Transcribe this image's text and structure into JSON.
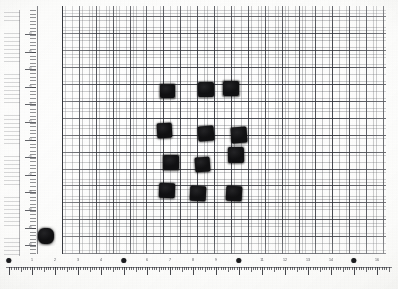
{
  "image": {
    "kind": "scanned-photograph",
    "subject": "black square specimens arranged on graph paper",
    "background_color": "#fdfdfc",
    "specimen_color": "#121214",
    "grid_minor_color": "#46484e",
    "grid_major_color": "#2d2f36",
    "ruler_text_color": "#53555b"
  },
  "grid": {
    "label": "graph-paper",
    "minor_cell_px": 3.38,
    "major_cell_px": 16.9,
    "minor_per_major": 5,
    "left_px": 62,
    "top_px": 6,
    "width_px": 324,
    "height_px": 248
  },
  "specimens": {
    "count": 13,
    "note": "12 squares in a clustered array plus 1 isolated square at lower left",
    "items": [
      {
        "id": "s1",
        "x": 160,
        "y": 84,
        "w": 15,
        "h": 14,
        "shape": "square",
        "group": "array"
      },
      {
        "id": "s2",
        "x": 198,
        "y": 82,
        "w": 16,
        "h": 15,
        "shape": "square",
        "group": "array"
      },
      {
        "id": "s3",
        "x": 223,
        "y": 81,
        "w": 16,
        "h": 15,
        "shape": "square",
        "group": "array"
      },
      {
        "id": "s4",
        "x": 157,
        "y": 123,
        "w": 15,
        "h": 15,
        "shape": "square",
        "group": "array"
      },
      {
        "id": "s5",
        "x": 198,
        "y": 126,
        "w": 16,
        "h": 15,
        "shape": "square",
        "group": "array"
      },
      {
        "id": "s6",
        "x": 231,
        "y": 127,
        "w": 16,
        "h": 16,
        "shape": "square",
        "group": "array"
      },
      {
        "id": "s7",
        "x": 163,
        "y": 155,
        "w": 16,
        "h": 15,
        "shape": "square",
        "group": "array"
      },
      {
        "id": "s8",
        "x": 195,
        "y": 157,
        "w": 15,
        "h": 15,
        "shape": "square",
        "group": "array"
      },
      {
        "id": "s9",
        "x": 228,
        "y": 147,
        "w": 16,
        "h": 16,
        "shape": "square",
        "group": "array"
      },
      {
        "id": "s10",
        "x": 159,
        "y": 183,
        "w": 16,
        "h": 15,
        "shape": "square",
        "group": "array"
      },
      {
        "id": "s11",
        "x": 190,
        "y": 186,
        "w": 16,
        "h": 15,
        "shape": "square",
        "group": "array"
      },
      {
        "id": "s12",
        "x": 226,
        "y": 186,
        "w": 16,
        "h": 15,
        "shape": "square",
        "group": "array"
      },
      {
        "id": "s13",
        "x": 38,
        "y": 228,
        "w": 16,
        "h": 16,
        "shape": "blob",
        "group": "isolated"
      }
    ]
  },
  "vertical_ruler": {
    "name": "left-scale",
    "orientation": "vertical",
    "labels": [
      {
        "y": 30,
        "text": "40"
      },
      {
        "y": 48,
        "text": "35"
      },
      {
        "y": 65,
        "text": "30"
      },
      {
        "y": 83,
        "text": "25"
      },
      {
        "y": 100,
        "text": "20"
      },
      {
        "y": 118,
        "text": "15"
      },
      {
        "y": 136,
        "text": "10"
      },
      {
        "y": 153,
        "text": "05"
      },
      {
        "y": 171,
        "text": "00"
      },
      {
        "y": 188,
        "text": "95"
      },
      {
        "y": 206,
        "text": "90"
      },
      {
        "y": 224,
        "text": "85"
      },
      {
        "y": 241,
        "text": "80"
      }
    ]
  },
  "horizontal_ruler": {
    "name": "bottom-scale-bar",
    "orientation": "horizontal",
    "labels": [
      {
        "x": 9,
        "text": "0",
        "marker": "dot"
      },
      {
        "x": 32,
        "text": "1"
      },
      {
        "x": 55,
        "text": "2"
      },
      {
        "x": 78,
        "text": "3"
      },
      {
        "x": 101,
        "text": "4"
      },
      {
        "x": 124,
        "text": "5",
        "marker": "dot"
      },
      {
        "x": 147,
        "text": "6"
      },
      {
        "x": 170,
        "text": "7"
      },
      {
        "x": 193,
        "text": "8"
      },
      {
        "x": 216,
        "text": "9"
      },
      {
        "x": 239,
        "text": "10",
        "marker": "dot"
      },
      {
        "x": 262,
        "text": "11"
      },
      {
        "x": 285,
        "text": "12"
      },
      {
        "x": 308,
        "text": "13"
      },
      {
        "x": 331,
        "text": "14"
      },
      {
        "x": 354,
        "text": "15",
        "marker": "dot"
      },
      {
        "x": 377,
        "text": "16"
      }
    ],
    "caption": ""
  }
}
